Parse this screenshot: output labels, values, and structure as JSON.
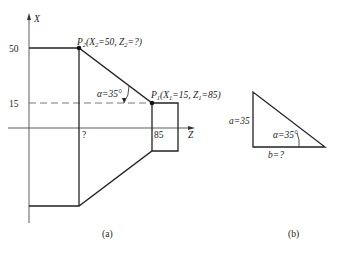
{
  "figure_a": {
    "axis_x_label": "X",
    "axis_z_label": "Z",
    "tick_50": "50",
    "tick_15": "15",
    "z_unknown": "?",
    "z_85": "85",
    "p2_label": "P",
    "p2_sub": "2",
    "p2_coords": "(X",
    "p2_x_sub": "2",
    "p2_x_val": "=50, Z",
    "p2_z_sub": "2",
    "p2_z_val": "=?)",
    "p1_label": "P",
    "p1_sub": "1",
    "p1_coords": "(X",
    "p1_x_sub": "1",
    "p1_x_val": "=15, Z",
    "p1_z_sub": "1",
    "p1_z_val": "=85)",
    "angle_label": "α=35°",
    "caption": "(a)"
  },
  "figure_b": {
    "side_a": "a=35",
    "side_b": "b=?",
    "angle_label": "α=35°",
    "caption": "(b)"
  },
  "colors": {
    "stroke": "#222222",
    "dashed": "#555555"
  }
}
